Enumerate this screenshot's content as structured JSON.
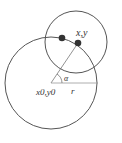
{
  "diagram": {
    "colors": {
      "stroke": "#555555",
      "dot": "#333333",
      "text": "#333333",
      "background": "#ffffff"
    },
    "big_circle": {
      "cx": 51,
      "cy": 83,
      "r": 46
    },
    "small_circle": {
      "cx": 76,
      "cy": 42,
      "r": 31
    },
    "points": [
      {
        "x": 62,
        "y": 38
      },
      {
        "x": 78,
        "y": 43
      }
    ],
    "labels": {
      "point": "x,y",
      "angle": "α",
      "center": "x0,y0",
      "radius": "r"
    }
  }
}
